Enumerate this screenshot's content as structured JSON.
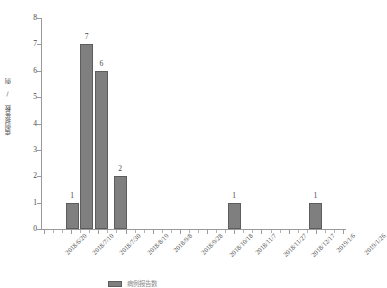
{
  "chart_data": {
    "type": "bar",
    "title": "",
    "xlabel": "",
    "ylabel": "病例报告数 / 例",
    "ylim": [
      0,
      8
    ],
    "ytick_labels": [
      "0",
      "1",
      "2",
      "3",
      "4",
      "5",
      "6",
      "7",
      "8"
    ],
    "ytick_values": [
      0,
      1,
      2,
      3,
      4,
      5,
      6,
      7,
      8
    ],
    "grid": false,
    "legend_position": "bottom",
    "legend_entries": [
      "病例报告数"
    ],
    "x_axis_tick_labels": [
      "2018/6/20",
      "2018/7/10",
      "2018/7/30",
      "2018/8/19",
      "2018/9/8",
      "2018/9/28",
      "2018/10/18",
      "2018/11/7",
      "2018/11/27",
      "2018/12/17",
      "2019/1/6",
      "2019/1/26"
    ],
    "bars": [
      {
        "label": "1",
        "value": 1,
        "x_frac": 0.094
      },
      {
        "label": "7",
        "value": 7,
        "x_frac": 0.143
      },
      {
        "label": "6",
        "value": 6,
        "x_frac": 0.192
      },
      {
        "label": "2",
        "value": 2,
        "x_frac": 0.255
      },
      {
        "label": "1",
        "value": 1,
        "x_frac": 0.636
      },
      {
        "label": "1",
        "value": 1,
        "x_frac": 0.908
      }
    ],
    "categories": [
      "2018/6/20",
      "2018/7/10",
      "2018/7/30",
      "2018/8/19",
      "2018/9/8",
      "2018/9/28",
      "2018/10/18",
      "2018/11/7",
      "2018/11/27",
      "2018/12/17",
      "2019/1/6",
      "2019/1/26"
    ],
    "values": [
      0,
      1,
      7,
      6,
      2,
      0,
      0,
      0,
      1,
      0,
      0,
      1
    ],
    "colors": {
      "bar_fill": "#7f7f7f",
      "bar_edge": "#5d5d5d",
      "axis": "#9a9a9a",
      "text": "#4a4a4a",
      "background": "#ffffff"
    }
  }
}
